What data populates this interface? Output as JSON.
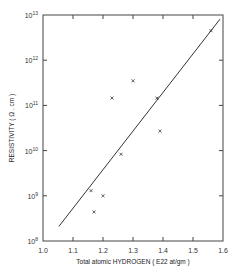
{
  "chart_data": {
    "type": "scatter",
    "title": "",
    "xlabel": "Total atomic HYDROGEN  ( E22 at/gm )",
    "ylabel": "RESISTIVITY  ( Ω . cm )",
    "xlim": [
      1.0,
      1.6
    ],
    "ylim": [
      100000000.0,
      10000000000000.0
    ],
    "yscale": "log",
    "grid": false,
    "x_ticks": [
      "1.0",
      "1.1",
      "1.2",
      "1.3",
      "1.4",
      "1.5",
      "1.6"
    ],
    "y_ticks": [
      {
        "base": "10",
        "exp": "8"
      },
      {
        "base": "10",
        "exp": "9"
      },
      {
        "base": "10",
        "exp": "10"
      },
      {
        "base": "10",
        "exp": "11"
      },
      {
        "base": "10",
        "exp": "12"
      },
      {
        "base": "10",
        "exp": "13"
      }
    ],
    "series": [
      {
        "name": "measured",
        "marker": "x",
        "points": [
          {
            "x": 1.16,
            "y": 1300000000.0
          },
          {
            "x": 1.17,
            "y": 440000000.0
          },
          {
            "x": 1.2,
            "y": 1000000000.0
          },
          {
            "x": 1.23,
            "y": 145000000000.0
          },
          {
            "x": 1.26,
            "y": 8300000000.0
          },
          {
            "x": 1.3,
            "y": 350000000000.0
          },
          {
            "x": 1.38,
            "y": 145000000000.0
          },
          {
            "x": 1.39,
            "y": 27000000000.0
          },
          {
            "x": 1.56,
            "y": 4500000000000.0
          }
        ]
      },
      {
        "name": "fit",
        "type": "line",
        "points": [
          {
            "x": 1.053,
            "y": 210000000.0
          },
          {
            "x": 1.59,
            "y": 8100000000000.0
          }
        ]
      }
    ]
  }
}
